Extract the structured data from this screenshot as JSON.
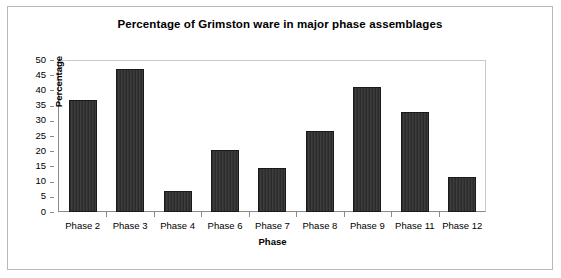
{
  "chart_data": {
    "type": "bar",
    "title": "Percentage of Grimston ware in major phase assemblages",
    "xlabel": "Phase",
    "ylabel": "Percentage",
    "categories": [
      "Phase 2",
      "Phase 3",
      "Phase 4",
      "Phase 6",
      "Phase 7",
      "Phase 8",
      "Phase 9",
      "Phase 11",
      "Phase 12"
    ],
    "values": [
      37,
      47,
      7,
      20.5,
      14.5,
      26.5,
      41,
      33,
      11.5
    ],
    "ylim": [
      0,
      50
    ],
    "ytick_step": 5,
    "yticks": [
      50,
      45,
      40,
      35,
      30,
      25,
      20,
      15,
      10,
      5,
      0
    ],
    "grid": false,
    "legend": false,
    "series_name": "Percentage of Grimston ware",
    "bar_color": "#333333",
    "bar_border_color": "#1a1a1a",
    "axis_color": "#8a8a8a",
    "background_color": "#ffffff",
    "frame_color": "#b8b8b8"
  }
}
